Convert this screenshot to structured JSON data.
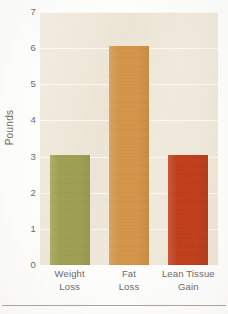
{
  "chart_data": {
    "type": "bar",
    "title": "",
    "xlabel": "",
    "ylabel": "Pounds",
    "ylim": [
      0,
      7
    ],
    "ytick_values": [
      0,
      1,
      2,
      3,
      4,
      5,
      6,
      7
    ],
    "ytick_labels": [
      "0",
      "1",
      "2",
      "3",
      "4",
      "5",
      "6",
      "7"
    ],
    "grid": true,
    "legend": "none",
    "categories": [
      "Weight Loss",
      "Fat Loss",
      "Lean Tissue Gain"
    ],
    "category_lines": [
      [
        "Weight",
        "Loss"
      ],
      [
        "Fat",
        "Loss"
      ],
      [
        "Lean Tissue",
        "Gain"
      ]
    ],
    "values": [
      3.05,
      6.05,
      3.05
    ],
    "bars": [
      {
        "label": "Weight Loss",
        "value": 3.05,
        "color": "#a0a055"
      },
      {
        "label": "Fat Loss",
        "value": 6.05,
        "color": "#d39549"
      },
      {
        "label": "Lean Tissue Gain",
        "value": 3.05,
        "color": "#c0401d"
      }
    ],
    "colors": {
      "plot_background": "#ece5d5",
      "figure_background": "#fdfdfb",
      "gridline": "#fcfaf6",
      "axis_text": "#6d6a66",
      "baseline": "#968f80",
      "rule": "#a9a6a0"
    }
  }
}
